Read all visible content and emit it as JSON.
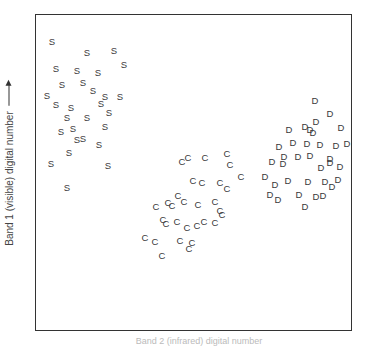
{
  "chart_data": {
    "type": "scatter",
    "title": "",
    "xlabel": "Band 2 (infrared) digital number",
    "ylabel": "Band 1 (visible) digital number",
    "xlim": [
      0,
      100
    ],
    "ylim": [
      0,
      100
    ],
    "grid": false,
    "legend": "none (points drawn as class letters S, C, D)",
    "frame_px": {
      "left": 35,
      "top": 14,
      "right": 352,
      "bottom": 331
    },
    "series": [
      {
        "name": "S",
        "marker": "S",
        "points_px": [
          [
            52,
            42
          ],
          [
            87,
            53
          ],
          [
            114,
            51
          ],
          [
            124,
            65
          ],
          [
            56,
            69
          ],
          [
            77,
            71
          ],
          [
            98,
            73
          ],
          [
            62,
            85
          ],
          [
            83,
            83
          ],
          [
            93,
            91
          ],
          [
            47,
            96
          ],
          [
            105,
            97
          ],
          [
            120,
            97
          ],
          [
            56,
            105
          ],
          [
            71,
            108
          ],
          [
            101,
            104
          ],
          [
            109,
            113
          ],
          [
            67,
            118
          ],
          [
            87,
            118
          ],
          [
            61,
            132
          ],
          [
            73,
            129
          ],
          [
            83,
            139
          ],
          [
            105,
            127
          ],
          [
            99,
            145
          ],
          [
            77,
            140
          ],
          [
            69,
            153
          ],
          [
            51,
            164
          ],
          [
            108,
            166
          ],
          [
            67,
            188
          ]
        ]
      },
      {
        "name": "C",
        "marker": "C",
        "points_px": [
          [
            182,
            162
          ],
          [
            188,
            158
          ],
          [
            205,
            158
          ],
          [
            227,
            154
          ],
          [
            230,
            165
          ],
          [
            241,
            177
          ],
          [
            193,
            181
          ],
          [
            202,
            183
          ],
          [
            220,
            183
          ],
          [
            227,
            189
          ],
          [
            178,
            196
          ],
          [
            184,
            202
          ],
          [
            156,
            207
          ],
          [
            168,
            203
          ],
          [
            172,
            206
          ],
          [
            198,
            205
          ],
          [
            215,
            202
          ],
          [
            220,
            211
          ],
          [
            163,
            220
          ],
          [
            166,
            224
          ],
          [
            177,
            222
          ],
          [
            187,
            228
          ],
          [
            204,
            222
          ],
          [
            197,
            226
          ],
          [
            215,
            223
          ],
          [
            145,
            238
          ],
          [
            155,
            242
          ],
          [
            180,
            241
          ],
          [
            192,
            243
          ],
          [
            189,
            249
          ],
          [
            162,
            256
          ],
          [
            222,
            215
          ]
        ]
      },
      {
        "name": "D",
        "marker": "D",
        "points_px": [
          [
            315,
            101
          ],
          [
            330,
            114
          ],
          [
            305,
            127
          ],
          [
            289,
            130
          ],
          [
            316,
            122
          ],
          [
            313,
            133
          ],
          [
            310,
            130
          ],
          [
            341,
            128
          ],
          [
            307,
            144
          ],
          [
            279,
            147
          ],
          [
            293,
            143
          ],
          [
            320,
            145
          ],
          [
            336,
            146
          ],
          [
            347,
            144
          ],
          [
            284,
            157
          ],
          [
            298,
            157
          ],
          [
            310,
            156
          ],
          [
            330,
            159
          ],
          [
            272,
            162
          ],
          [
            283,
            164
          ],
          [
            330,
            163
          ],
          [
            321,
            168
          ],
          [
            340,
            167
          ],
          [
            265,
            177
          ],
          [
            275,
            185
          ],
          [
            288,
            181
          ],
          [
            308,
            182
          ],
          [
            325,
            182
          ],
          [
            332,
            187
          ],
          [
            270,
            195
          ],
          [
            278,
            200
          ],
          [
            299,
            195
          ],
          [
            316,
            197
          ],
          [
            305,
            207
          ],
          [
            338,
            180
          ],
          [
            323,
            196
          ]
        ]
      }
    ]
  },
  "axes": {
    "ylabel": "Band 1 (visible) digital number",
    "xlabel": "Band 2 (infrared) digital number"
  }
}
